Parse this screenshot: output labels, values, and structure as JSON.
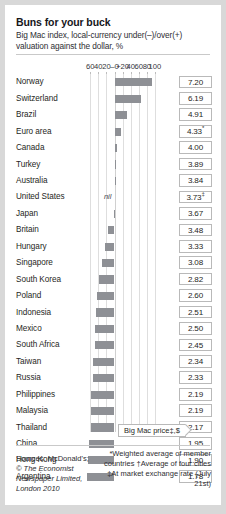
{
  "title": "Buns for your buck",
  "subtitle": "Big Mac index, local-currency under(–)/over(+) valuation against the dollar, %",
  "axis": {
    "ticks": [
      "60",
      "40",
      "20",
      "–0",
      "+20",
      "40",
      "60",
      "80",
      "100"
    ],
    "tick_values": [
      -60,
      -40,
      -20,
      0,
      20,
      40,
      60,
      80,
      100
    ],
    "min": -60,
    "max": 100
  },
  "callout": {
    "label": "Big Mac price‡,$"
  },
  "nil_label": "nil",
  "price_header": "Big Mac price‡,$",
  "sources_prefix": "Sources: McDonald's;",
  "sources_copyright": "© The Economist",
  "sources_pub": "Newspaper Limited,",
  "sources_place": "London 2010",
  "notes": [
    "*Weighted average of member",
    "countries †Average of four cities",
    "‡At market exchange rate (July 21st)"
  ],
  "colors": {
    "bar": "#8e9095",
    "grid": "#dedede",
    "card": "#ffffff",
    "page": "#d8d8d8",
    "text": "#1f1f24"
  },
  "chart_data": {
    "type": "bar",
    "title": "Buns for your buck",
    "subtitle": "Big Mac index, local-currency under(–)/over(+) valuation against the dollar, %",
    "xlabel": "",
    "ylabel": "",
    "xlim": [
      -60,
      100
    ],
    "grid": true,
    "orientation": "horizontal",
    "value_unit": "percent",
    "categories": [
      "Norway",
      "Switzerland",
      "Brazil",
      "Euro area",
      "Canada",
      "Turkey",
      "Australia",
      "United States",
      "Japan",
      "Britain",
      "Hungary",
      "Singapore",
      "South Korea",
      "Poland",
      "Indonesia",
      "Mexico",
      "South Africa",
      "Taiwan",
      "Russia",
      "Philippines",
      "Malaysia",
      "Thailand",
      "China",
      "Hong Kong",
      "Argentina"
    ],
    "values": [
      92,
      66,
      31,
      16,
      7,
      4,
      3,
      0,
      -2,
      -17,
      -23,
      -30,
      -38,
      -44,
      -46,
      -47,
      -48,
      -53,
      -54,
      -58,
      -58,
      -59,
      -64,
      -66,
      -68
    ],
    "price_label": "Big Mac price‡,$",
    "prices": [
      "7.20",
      "6.19",
      "4.91",
      "4.33",
      "4.00",
      "3.89",
      "3.84",
      "3.73",
      "3.67",
      "3.48",
      "3.33",
      "3.08",
      "2.82",
      "2.60",
      "2.51",
      "2.50",
      "2.45",
      "2.34",
      "2.33",
      "2.19",
      "2.19",
      "2.17",
      "1.95",
      "1.90",
      "1.78"
    ],
    "price_marks": [
      "",
      "",
      "",
      "*",
      "",
      "",
      "",
      "‡",
      "",
      "",
      "",
      "",
      "",
      "",
      "",
      "",
      "",
      "",
      "",
      "",
      "",
      "",
      "",
      "",
      ""
    ],
    "annotations": [
      {
        "category": "United States",
        "text": "nil"
      }
    ]
  }
}
